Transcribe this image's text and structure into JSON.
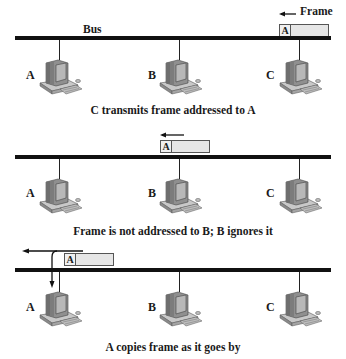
{
  "diagram": {
    "bus_label": "Bus",
    "frame_label": "Frame",
    "panels": [
      {
        "caption": "C transmits frame addressed to A",
        "frame_address": "A",
        "nodes": [
          "A",
          "B",
          "C"
        ]
      },
      {
        "caption": "Frame is not addressed to B; B ignores it",
        "frame_address": "A",
        "nodes": [
          "A",
          "B",
          "C"
        ]
      },
      {
        "caption": "A copies frame as it goes by",
        "frame_address": "A",
        "nodes": [
          "A",
          "B",
          "C"
        ]
      }
    ],
    "icons": {
      "computer": "desktop-computer-icon",
      "arrow": "left-arrow-icon",
      "copy_arrow": "down-arrow-icon"
    },
    "colors": {
      "bus": "#111111",
      "frame_fill": "#e6e6e6",
      "frame_border": "#555555",
      "computer_body": "#9a9a9a"
    }
  }
}
